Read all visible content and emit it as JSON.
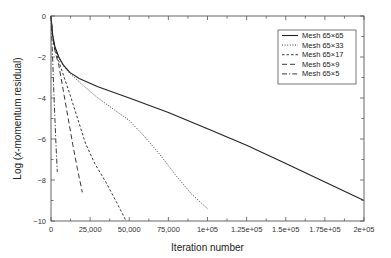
{
  "chart_data": {
    "type": "line",
    "title": "",
    "xlabel": "Iteration number",
    "ylabel": "Log (x-momentum residual)",
    "ylabel_parts": {
      "prefix": "Log (",
      "italic": "x",
      "suffix": "-momentum residual)"
    },
    "xlim": [
      0,
      200000
    ],
    "ylim": [
      -10,
      0
    ],
    "grid": false,
    "legend_position": "upper right",
    "x_ticks": [
      0,
      25000,
      50000,
      75000,
      100000,
      125000,
      150000,
      175000,
      200000
    ],
    "x_tick_labels": [
      "0",
      "25,000",
      "50,000",
      "75,000",
      "1e+05",
      "1.25e+05",
      "1.5e+05",
      "1.75e+05",
      "2e+05"
    ],
    "y_ticks": [
      0,
      -2,
      -4,
      -6,
      -8,
      -10
    ],
    "y_tick_labels": [
      "0",
      "−2",
      "−4",
      "−6",
      "−8",
      "−10"
    ],
    "series": [
      {
        "name": "Mesh 65×65",
        "style": "solid",
        "x": [
          0,
          1000,
          2500,
          5000,
          8000,
          12000,
          18000,
          30000,
          50000,
          75000,
          100000,
          125000,
          150000,
          175000,
          200000
        ],
        "y": [
          0,
          -0.9,
          -1.5,
          -2.0,
          -2.4,
          -2.75,
          -3.05,
          -3.45,
          -4.0,
          -4.7,
          -5.5,
          -6.3,
          -7.2,
          -8.1,
          -9.0
        ]
      },
      {
        "name": "Mesh 65×33",
        "style": "dotted",
        "x": [
          0,
          1000,
          2500,
          5000,
          8000,
          12000,
          20000,
          30000,
          40000,
          50000,
          60000,
          70000,
          80000,
          90000,
          100000
        ],
        "y": [
          0,
          -0.9,
          -1.5,
          -2.05,
          -2.45,
          -2.8,
          -3.35,
          -4.0,
          -4.55,
          -5.1,
          -5.9,
          -6.8,
          -7.8,
          -8.7,
          -9.4
        ]
      },
      {
        "name": "Mesh 65×17",
        "style": "dashed-short",
        "x": [
          0,
          1000,
          2500,
          5000,
          8000,
          12000,
          17000,
          22000,
          28000,
          35000,
          42000,
          48000
        ],
        "y": [
          0,
          -1.0,
          -1.6,
          -2.2,
          -2.9,
          -3.8,
          -5.0,
          -6.2,
          -7.2,
          -8.1,
          -9.1,
          -10.0
        ]
      },
      {
        "name": "Mesh 65×9",
        "style": "dashed-long",
        "x": [
          0,
          1000,
          2500,
          5000,
          8000,
          11000,
          14000,
          17000,
          20000
        ],
        "y": [
          0,
          -1.0,
          -1.7,
          -2.4,
          -3.7,
          -5.0,
          -6.3,
          -7.5,
          -8.6
        ]
      },
      {
        "name": "Mesh 65×5",
        "style": "dash-dot",
        "x": [
          0,
          600,
          1200,
          1800,
          2500,
          3200,
          4000
        ],
        "y": [
          0,
          -1.2,
          -2.4,
          -3.7,
          -5.0,
          -6.3,
          -7.6
        ]
      }
    ]
  },
  "colors": {
    "line": "#222222",
    "axis": "#555555",
    "text": "#333333",
    "background": "#ffffff"
  }
}
